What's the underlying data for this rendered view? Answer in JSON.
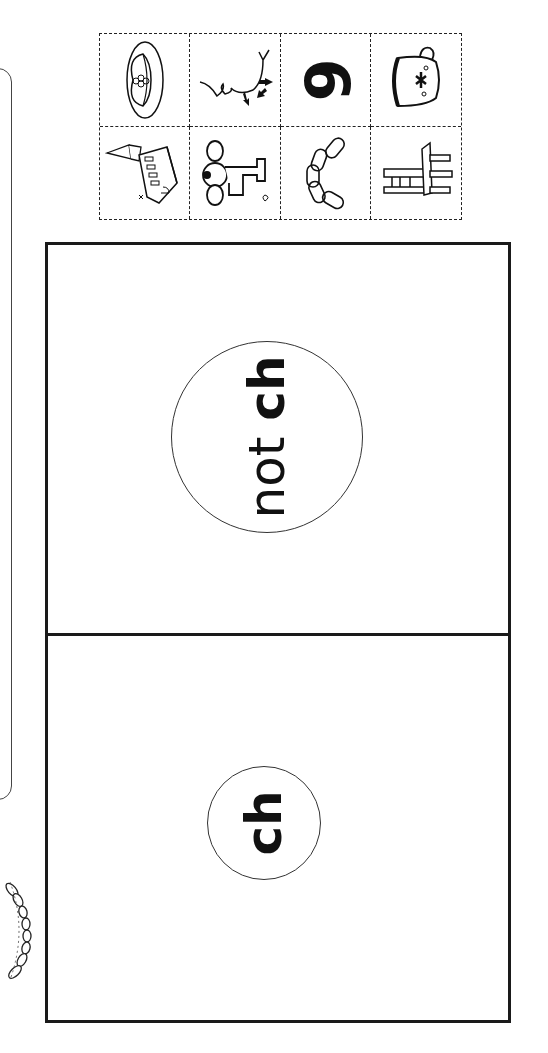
{
  "worksheet": {
    "picture_cards": [
      {
        "name": "hat",
        "row": 1,
        "col": 1
      },
      {
        "name": "chin",
        "row": 1,
        "col": 2
      },
      {
        "name": "six",
        "row": 1,
        "col": 3,
        "glyph": "6"
      },
      {
        "name": "teacup",
        "row": 1,
        "col": 4
      },
      {
        "name": "church",
        "row": 2,
        "col": 1
      },
      {
        "name": "tap",
        "row": 2,
        "col": 2
      },
      {
        "name": "chain",
        "row": 2,
        "col": 3
      },
      {
        "name": "chair",
        "row": 2,
        "col": 4
      }
    ],
    "sort_columns": [
      {
        "id": "not-ch",
        "prefix": "not ",
        "target": "ch"
      },
      {
        "id": "ch",
        "prefix": "",
        "target": "ch"
      }
    ]
  }
}
